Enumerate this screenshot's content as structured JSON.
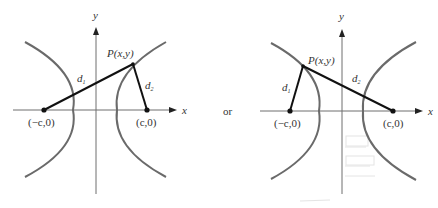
{
  "figure": {
    "connector_word": "or",
    "panels": [
      {
        "id": "left",
        "axis_x_label": "x",
        "axis_y_label": "y",
        "point_label": "P(x,y)",
        "focus_left_label": "(−c,0)",
        "focus_right_label": "(c,0)",
        "distance_1_label": "d",
        "distance_1_sub": "1",
        "distance_2_label": "d",
        "distance_2_sub": "2",
        "point_on_branch": "right"
      },
      {
        "id": "right",
        "axis_x_label": "x",
        "axis_y_label": "y",
        "point_label": "P(x,y)",
        "focus_left_label": "(−c,0)",
        "focus_right_label": "(c,0)",
        "distance_1_label": "d",
        "distance_1_sub": "1",
        "distance_2_label": "d",
        "distance_2_sub": "2",
        "point_on_branch": "left"
      }
    ],
    "colors": {
      "background": "#ffffff",
      "hyperbola": "#6a6a6a",
      "segments": "#111111",
      "axes": "#6e6e6e",
      "text": "#333333"
    }
  }
}
